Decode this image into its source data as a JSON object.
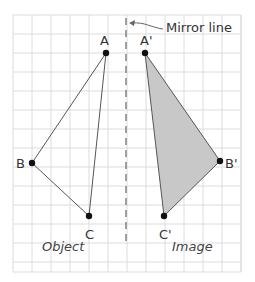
{
  "diagram": {
    "annotation": "Mirror line",
    "captions": {
      "object": "Object",
      "image": "Image"
    },
    "colors": {
      "grid": "#dcdcdc",
      "line": "#555555",
      "point": "#111111",
      "image_fill": "#c8c8c8",
      "mirror": "#666666"
    },
    "grid": {
      "x0": 13,
      "y0": 15,
      "x1": 241,
      "y1": 272,
      "step": 19
    },
    "mirror_line": {
      "x": 126,
      "y_top": 18,
      "y_bottom": 246
    },
    "object": {
      "points": [
        {
          "label": "A",
          "x": 106,
          "y": 53
        },
        {
          "label": "B",
          "x": 32,
          "y": 163
        },
        {
          "label": "C",
          "x": 89,
          "y": 216
        }
      ]
    },
    "image": {
      "points": [
        {
          "label": "A'",
          "x": 145,
          "y": 53
        },
        {
          "label": "B'",
          "x": 220,
          "y": 161
        },
        {
          "label": "C'",
          "x": 164,
          "y": 216
        }
      ]
    }
  }
}
